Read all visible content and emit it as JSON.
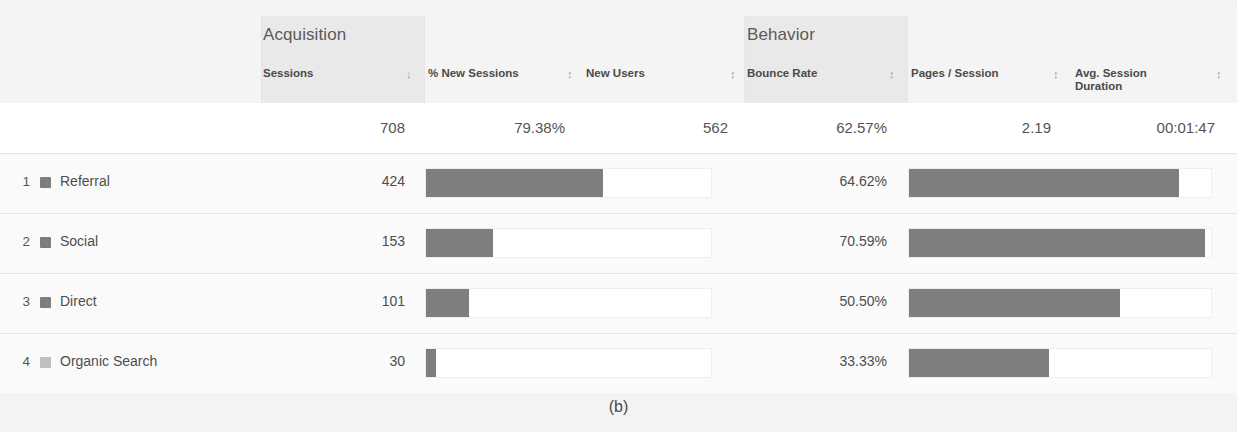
{
  "caption": "(b)",
  "groups": [
    {
      "name": "acquisition",
      "label": "Acquisition"
    },
    {
      "name": "behavior",
      "label": "Behavior"
    }
  ],
  "columns": [
    {
      "key": "channel",
      "label": "",
      "sort_icon": ""
    },
    {
      "key": "sessions",
      "label": "Sessions",
      "sort_icon": "sort-descending-icon",
      "sort_glyph": "↓"
    },
    {
      "key": "pct_new_sessions",
      "label": "% New Sessions",
      "sort_icon": "sort-icon",
      "sort_glyph": "↕"
    },
    {
      "key": "new_users",
      "label": "New Users",
      "sort_icon": "sort-icon",
      "sort_glyph": "↕"
    },
    {
      "key": "bounce_rate",
      "label": "Bounce Rate",
      "sort_icon": "sort-icon",
      "sort_glyph": "↕"
    },
    {
      "key": "pages_session",
      "label": "Pages / Session",
      "sort_icon": "sort-icon",
      "sort_glyph": "↕"
    },
    {
      "key": "avg_session_duration",
      "label": "Avg. Session\nDuration",
      "label_line1": "Avg. Session",
      "label_line2": "Duration",
      "sort_icon": "sort-icon",
      "sort_glyph": "↕"
    }
  ],
  "totals": {
    "sessions": "708",
    "pct_new_sessions": "79.38%",
    "new_users": "562",
    "bounce_rate": "62.57%",
    "pages_session": "2.19",
    "avg_session_duration": "00:01:47"
  },
  "rows": [
    {
      "rank": "1",
      "channel": "Referral",
      "swatch_color": "#7d7d7d",
      "sessions": "424",
      "bounce_rate": "64.62%",
      "acq_bar_pct": 62.0,
      "beh_bar_pct": 89.5
    },
    {
      "rank": "2",
      "channel": "Social",
      "swatch_color": "#7d7d7d",
      "sessions": "153",
      "bounce_rate": "70.59%",
      "acq_bar_pct": 23.5,
      "beh_bar_pct": 98.0
    },
    {
      "rank": "3",
      "channel": "Direct",
      "swatch_color": "#7d7d7d",
      "sessions": "101",
      "bounce_rate": "50.50%",
      "acq_bar_pct": 15.0,
      "beh_bar_pct": 70.0
    },
    {
      "rank": "4",
      "channel": "Organic Search",
      "swatch_color": "#bfbfbf",
      "sessions": "30",
      "bounce_rate": "33.33%",
      "acq_bar_pct": 3.6,
      "beh_bar_pct": 46.5
    }
  ],
  "chart_data": {
    "type": "table",
    "title": "",
    "columns": [
      "Channel",
      "Sessions",
      "% New Sessions",
      "New Users",
      "Bounce Rate",
      "Pages / Session",
      "Avg. Session Duration"
    ],
    "totals_row": [
      "",
      "708",
      "79.38%",
      "562",
      "62.57%",
      "2.19",
      "00:01:47"
    ],
    "rows": [
      [
        "Referral",
        "424",
        "",
        "",
        "64.62%",
        "",
        ""
      ],
      [
        "Social",
        "153",
        "",
        "",
        "70.59%",
        "",
        ""
      ],
      [
        "Direct",
        "101",
        "",
        "",
        "50.50%",
        "",
        ""
      ],
      [
        "Organic Search",
        "30",
        "",
        "",
        "33.33%",
        "",
        ""
      ]
    ],
    "bar_series": [
      {
        "name": "Sessions (bar, Acquisition block)",
        "categories": [
          "Referral",
          "Social",
          "Direct",
          "Organic Search"
        ],
        "values": [
          424,
          153,
          101,
          30
        ],
        "max": 708
      },
      {
        "name": "Bounce Rate (bar, Behavior block)",
        "categories": [
          "Referral",
          "Social",
          "Direct",
          "Organic Search"
        ],
        "values": [
          64.62,
          70.59,
          50.5,
          33.33
        ],
        "max": 72.0,
        "unit": "%"
      }
    ],
    "grid": false,
    "legend": "none"
  }
}
